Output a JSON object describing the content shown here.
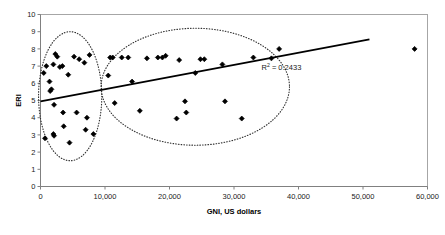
{
  "chart_data": {
    "type": "scatter",
    "title": "",
    "xlabel": "GNI, US dollars",
    "ylabel": "ERI",
    "xlim": [
      0,
      60000
    ],
    "ylim": [
      0,
      10
    ],
    "grid": false,
    "legend": "none",
    "xticks": [
      0,
      10000,
      20000,
      30000,
      40000,
      50000,
      60000
    ],
    "xticklabels": [
      "0",
      "10,000",
      "20,000",
      "30,000",
      "40,000",
      "50,000",
      "60,000"
    ],
    "yticks": [
      0,
      1,
      2,
      3,
      4,
      5,
      6,
      7,
      8,
      9,
      10
    ],
    "yticklabels": [
      "0",
      "1",
      "2",
      "3",
      "4",
      "5",
      "6",
      "7",
      "8",
      "9",
      "10"
    ],
    "marker": "diamond",
    "marker_color": "#000000",
    "points": [
      {
        "x": 500,
        "y": 6.6
      },
      {
        "x": 900,
        "y": 7.0
      },
      {
        "x": 1400,
        "y": 6.1
      },
      {
        "x": 1500,
        "y": 5.55
      },
      {
        "x": 1700,
        "y": 5.65
      },
      {
        "x": 2000,
        "y": 7.1
      },
      {
        "x": 2300,
        "y": 7.7
      },
      {
        "x": 2600,
        "y": 7.55
      },
      {
        "x": 3000,
        "y": 6.95
      },
      {
        "x": 3400,
        "y": 7.0
      },
      {
        "x": 4300,
        "y": 6.5
      },
      {
        "x": 5200,
        "y": 7.55
      },
      {
        "x": 6000,
        "y": 7.4
      },
      {
        "x": 6800,
        "y": 7.2
      },
      {
        "x": 7600,
        "y": 7.65
      },
      {
        "x": 2100,
        "y": 4.75
      },
      {
        "x": 3500,
        "y": 4.3
      },
      {
        "x": 5600,
        "y": 4.3
      },
      {
        "x": 7200,
        "y": 4.0
      },
      {
        "x": 3600,
        "y": 3.5
      },
      {
        "x": 7000,
        "y": 3.3
      },
      {
        "x": 700,
        "y": 2.8
      },
      {
        "x": 2000,
        "y": 3.05
      },
      {
        "x": 2100,
        "y": 2.95
      },
      {
        "x": 4500,
        "y": 2.55
      },
      {
        "x": 8200,
        "y": 3.05
      },
      {
        "x": 10500,
        "y": 6.45
      },
      {
        "x": 10800,
        "y": 7.5
      },
      {
        "x": 11200,
        "y": 7.5
      },
      {
        "x": 11500,
        "y": 4.85
      },
      {
        "x": 12600,
        "y": 7.5
      },
      {
        "x": 13600,
        "y": 7.5
      },
      {
        "x": 14200,
        "y": 6.1
      },
      {
        "x": 16500,
        "y": 7.45
      },
      {
        "x": 18200,
        "y": 7.5
      },
      {
        "x": 18900,
        "y": 7.5
      },
      {
        "x": 19400,
        "y": 7.6
      },
      {
        "x": 15400,
        "y": 4.4
      },
      {
        "x": 21100,
        "y": 3.95
      },
      {
        "x": 21500,
        "y": 7.35
      },
      {
        "x": 22600,
        "y": 4.3
      },
      {
        "x": 24000,
        "y": 6.6
      },
      {
        "x": 24800,
        "y": 7.4
      },
      {
        "x": 25400,
        "y": 7.4
      },
      {
        "x": 22400,
        "y": 4.95
      },
      {
        "x": 28200,
        "y": 7.1
      },
      {
        "x": 28600,
        "y": 4.95
      },
      {
        "x": 31200,
        "y": 3.95
      },
      {
        "x": 33000,
        "y": 7.5
      },
      {
        "x": 35800,
        "y": 7.45
      },
      {
        "x": 37000,
        "y": 8.0
      },
      {
        "x": 58000,
        "y": 8.0
      }
    ],
    "trendline": {
      "label": "linear-trendline",
      "color": "#000000",
      "x_start": 0,
      "y_start": 4.95,
      "x_end": 51000,
      "y_end": 8.55
    },
    "annotations": [
      {
        "name": "r-squared",
        "text_prefix": "R",
        "text_sup": "2",
        "text_suffix": " = 0.2433",
        "value": 0.2433,
        "x": 40000,
        "y": 6.8
      }
    ],
    "ellipses": [
      {
        "name": "low-gni-cluster-ellipse",
        "style": "dotted",
        "cx": 4600,
        "cy": 5.25,
        "rx": 4900,
        "ry": 3.75
      },
      {
        "name": "high-gni-cluster-ellipse",
        "style": "dotted",
        "cx": 24000,
        "cy": 5.8,
        "rx": 14600,
        "ry": 3.4
      }
    ]
  }
}
